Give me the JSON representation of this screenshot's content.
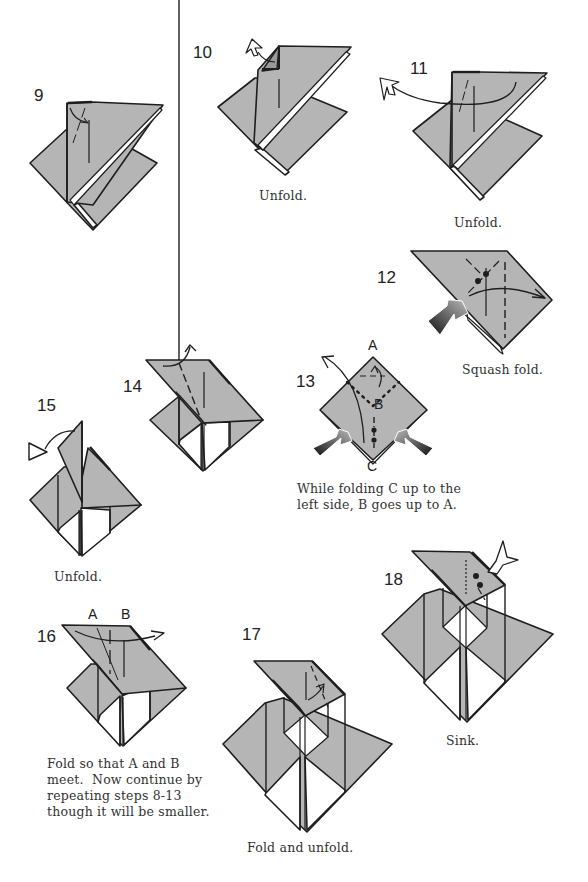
{
  "colors": {
    "paper": "#b5b5b5",
    "paper_light": "#c2c2c2",
    "line": "#1e1e1e",
    "white": "#ffffff",
    "text": "#222222"
  },
  "steps": [
    {
      "number": "9",
      "caption": ""
    },
    {
      "number": "10",
      "caption": "Unfold."
    },
    {
      "number": "11",
      "caption": "Unfold."
    },
    {
      "number": "12",
      "caption": "Squash fold."
    },
    {
      "number": "13",
      "caption": "While folding C up to the\nleft side, B goes up to A.",
      "point_labels": [
        "A",
        "B",
        "C"
      ]
    },
    {
      "number": "14",
      "caption": ""
    },
    {
      "number": "15",
      "caption": "Unfold."
    },
    {
      "number": "16",
      "caption": "Fold so that A and B\nmeet.  Now continue by\nrepeating steps 8-13\nthough it will be smaller.",
      "point_labels": [
        "A",
        "B"
      ]
    },
    {
      "number": "17",
      "caption": "Fold and unfold."
    },
    {
      "number": "18",
      "caption": "Sink."
    }
  ]
}
